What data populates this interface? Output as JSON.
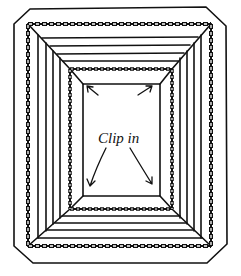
{
  "diagram": {
    "label": "Clip in",
    "colors": {
      "ink": "#111111",
      "background": "#ffffff"
    }
  }
}
